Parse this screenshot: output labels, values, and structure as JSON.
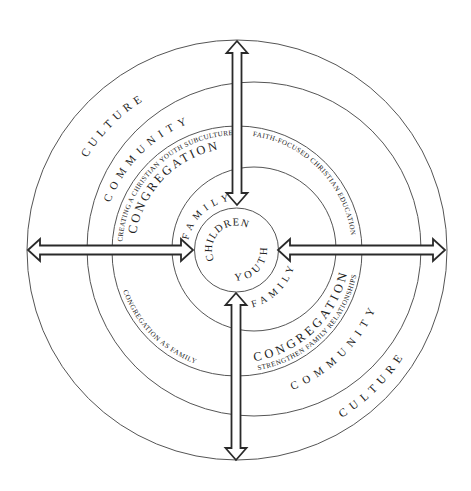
{
  "diagram": {
    "rings": {
      "culture": {
        "label_upper_left": "CULTURE",
        "label_lower_right": "CULTURE"
      },
      "community": {
        "label_upper_left": "COMMUNITY",
        "label_lower_right": "COMMUNITY"
      },
      "congregation": {
        "label_upper_left": "CONGREGATION",
        "label_lower_right": "CONGREGATION"
      },
      "family": {
        "label_upper_left": "FAMILY",
        "label_lower_right": "FAMILY"
      },
      "core": {
        "label_top": "CHILDREN",
        "label_bottom": "YOUTH"
      }
    },
    "strategies": {
      "upper_left": "CREATING A CHRISTIAN YOUTH SUBCULTURE",
      "upper_right": "FAITH-FOCUSED CHRISTIAN EDUCATION",
      "lower_left": "CONGREGATION AS FAMILY",
      "lower_right": "STRENGTHEN FAMILY RELATIONSHIPS"
    },
    "arrows": [
      {
        "position": "top",
        "icon": "double-arrow-vertical-icon"
      },
      {
        "position": "bottom",
        "icon": "double-arrow-vertical-icon"
      },
      {
        "position": "left",
        "icon": "double-arrow-horizontal-icon"
      },
      {
        "position": "right",
        "icon": "double-arrow-horizontal-icon"
      }
    ],
    "colors": {
      "background": "#ffffff",
      "ring_line": "#555555",
      "text": "#222222",
      "arrow_stroke": "#2a2a2a",
      "arrow_fill": "#ffffff"
    }
  }
}
